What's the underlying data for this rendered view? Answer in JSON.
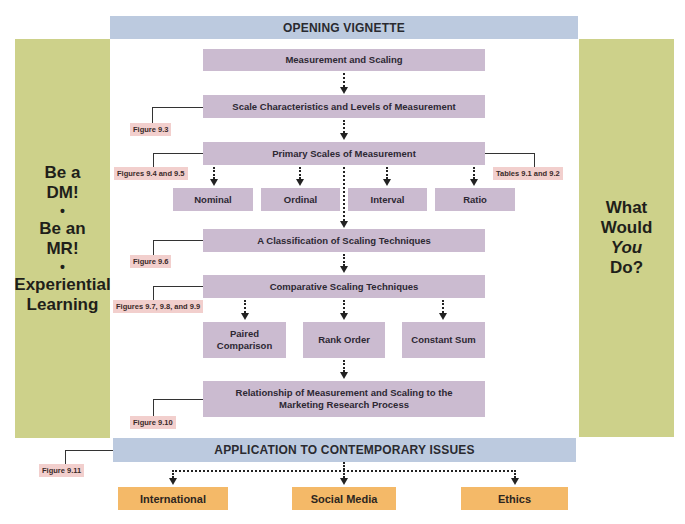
{
  "header": {
    "title": "OPENING VIGNETTE"
  },
  "left_panel": {
    "lines": [
      "Be a",
      "DM!",
      "•",
      "Be an",
      "MR!",
      "•",
      "Experiential",
      "Learning"
    ]
  },
  "right_panel": {
    "lines": [
      "What",
      "Would",
      "You",
      "Do?"
    ]
  },
  "flow": {
    "measurement_scaling": "Measurement and Scaling",
    "scale_characteristics": "Scale Characteristics and Levels of Measurement",
    "primary_scales": "Primary Scales of Measurement",
    "primary_children": [
      "Nominal",
      "Ordinal",
      "Interval",
      "Ratio"
    ],
    "classification": "A Classification of Scaling Techniques",
    "comparative": "Comparative Scaling Techniques",
    "comparative_children": [
      "Paired Comparison",
      "Rank Order",
      "Constant Sum"
    ],
    "relationship_line1": "Relationship of Measurement and Scaling to the",
    "relationship_line2": "Marketing Research Process"
  },
  "references": {
    "fig_9_3": "Figure 9.3",
    "fig_9_4_9_5": "Figures 9.4 and 9.5",
    "tables_9_1_9_2": "Tables 9.1 and 9.2",
    "fig_9_6": "Figure 9.6",
    "fig_9_7_9_8_9_9": "Figures 9.7, 9.8, and 9.9",
    "fig_9_10": "Figure 9.10",
    "fig_9_11": "Figure 9.11"
  },
  "footer": {
    "title": "APPLICATION TO CONTEMPORARY ISSUES",
    "children": [
      "International",
      "Social Media",
      "Ethics"
    ]
  },
  "colors": {
    "header_blue": "#bccadf",
    "side_green": "#cdd18a",
    "box_purple": "#cbbbd0",
    "box_orange": "#f4b968",
    "ref_pink": "#f2cfcd"
  }
}
